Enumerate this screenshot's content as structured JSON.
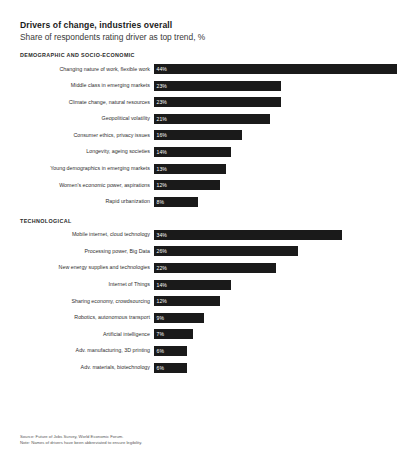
{
  "header": {
    "title": "Drivers of change, industries overall",
    "subtitle": "Share of respondents rating driver as top trend, %"
  },
  "sections": [
    {
      "heading": "DEMOGRAPHIC AND SOCIO-ECONOMIC",
      "rows": [
        {
          "label": "Changing nature of work, flexible work",
          "value": 44,
          "value_label": "44%"
        },
        {
          "label": "Middle class in emerging markets",
          "value": 23,
          "value_label": "23%"
        },
        {
          "label": "Climate change, natural resources",
          "value": 23,
          "value_label": "23%"
        },
        {
          "label": "Geopolitical volatility",
          "value": 21,
          "value_label": "21%"
        },
        {
          "label": "Consumer ethics, privacy issues",
          "value": 16,
          "value_label": "16%"
        },
        {
          "label": "Longevity, ageing societies",
          "value": 14,
          "value_label": "14%"
        },
        {
          "label": "Young demographics in emerging markets",
          "value": 13,
          "value_label": "13%"
        },
        {
          "label": "Women's economic power, aspirations",
          "value": 12,
          "value_label": "12%"
        },
        {
          "label": "Rapid urbanization",
          "value": 8,
          "value_label": "8%"
        }
      ]
    },
    {
      "heading": "TECHNOLOGICAL",
      "rows": [
        {
          "label": "Mobile internet, cloud technology",
          "value": 34,
          "value_label": "34%"
        },
        {
          "label": "Processing power, Big Data",
          "value": 26,
          "value_label": "26%"
        },
        {
          "label": "New energy supplies and technologies",
          "value": 22,
          "value_label": "22%"
        },
        {
          "label": "Internet of Things",
          "value": 14,
          "value_label": "14%"
        },
        {
          "label": "Sharing economy, crowdsourcing",
          "value": 12,
          "value_label": "12%"
        },
        {
          "label": "Robotics, autonomous transport",
          "value": 9,
          "value_label": "9%"
        },
        {
          "label": "Artificial intelligence",
          "value": 7,
          "value_label": "7%"
        },
        {
          "label": "Adv. manufacturing, 3D printing",
          "value": 6,
          "value_label": "6%"
        },
        {
          "label": "Adv. materials, biotechnology",
          "value": 6,
          "value_label": "6%"
        }
      ]
    }
  ],
  "footnotes": [
    "Source: Future of Jobs Survey, World Economic Forum.",
    "Note: Names of drivers have been abbreviated to ensure legibility."
  ],
  "style": {
    "bar_color": "#1a1a1a",
    "value_text_color": "#ffffff",
    "background": "#ffffff",
    "axis_max": 44
  },
  "chart_data": {
    "type": "bar",
    "orientation": "horizontal",
    "title": "Drivers of change, industries overall",
    "subtitle": "Share of respondents rating driver as top trend, %",
    "xlabel": "Share of respondents rating driver as top trend, %",
    "ylabel": "",
    "xlim": [
      0,
      44
    ],
    "grid": false,
    "legend": null,
    "groups": [
      {
        "name": "DEMOGRAPHIC AND SOCIO-ECONOMIC",
        "categories": [
          "Changing nature of work, flexible work",
          "Middle class in emerging markets",
          "Climate change, natural resources",
          "Geopolitical volatility",
          "Consumer ethics, privacy issues",
          "Longevity, ageing societies",
          "Young demographics in emerging markets",
          "Women's economic power, aspirations",
          "Rapid urbanization"
        ],
        "values": [
          44,
          23,
          23,
          21,
          16,
          14,
          13,
          12,
          8
        ]
      },
      {
        "name": "TECHNOLOGICAL",
        "categories": [
          "Mobile internet, cloud technology",
          "Processing power, Big Data",
          "New energy supplies and technologies",
          "Internet of Things",
          "Sharing economy, crowdsourcing",
          "Robotics, autonomous transport",
          "Artificial intelligence",
          "Adv. manufacturing, 3D printing",
          "Adv. materials, biotechnology"
        ],
        "values": [
          34,
          26,
          22,
          14,
          12,
          9,
          7,
          6,
          6
        ]
      }
    ],
    "annotations": [
      "Source: Future of Jobs Survey, World Economic Forum.",
      "Note: Names of drivers have been abbreviated to ensure legibility."
    ]
  }
}
